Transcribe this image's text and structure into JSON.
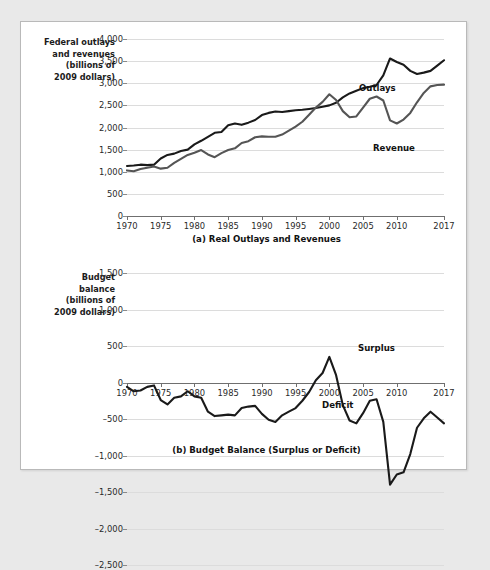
{
  "figure": {
    "background_color": "#e9e9e9",
    "card_color": "#ffffff",
    "border_color": "#b9b9b9"
  },
  "panel_a": {
    "axis_title": "Federal outlays\nand revenues\n(billions of\n2009 dollars)",
    "caption": "(a) Real Outlays and Revenues",
    "series_labels": {
      "outlays": "Outlays",
      "revenue": "Revenue"
    }
  },
  "panel_b": {
    "axis_title": "Budget\nbalance\n(billions of\n2009 dollars)",
    "caption": "(b) Budget Balance (Surplus or Deficit)",
    "series_labels": {
      "surplus": "Surplus",
      "deficit": "Deficit"
    }
  },
  "chart_data": [
    {
      "type": "line",
      "title": "(a) Real Outlays and Revenues",
      "xlabel": "",
      "ylabel": "Federal outlays and revenues (billions of 2009 dollars)",
      "xlim": [
        1970,
        2017
      ],
      "ylim": [
        0,
        4000
      ],
      "ytick_labels": [
        "4,000",
        "3,500",
        "3,000",
        "2,500",
        "2,000",
        "1,500",
        "1,000",
        "500",
        "0"
      ],
      "yticks": [
        4000,
        3500,
        3000,
        2500,
        2000,
        1500,
        1000,
        500,
        0
      ],
      "xtick_labels": [
        "1970",
        "1975",
        "1980",
        "1985",
        "1990",
        "1995",
        "2000",
        "2005",
        "2010",
        "2017"
      ],
      "xticks": [
        1970,
        1975,
        1980,
        1985,
        1990,
        1995,
        2000,
        2005,
        2010,
        2017
      ],
      "grid": true,
      "legend_position": "inline-annotation",
      "x": [
        1970,
        1971,
        1972,
        1973,
        1974,
        1975,
        1976,
        1977,
        1978,
        1979,
        1980,
        1981,
        1982,
        1983,
        1984,
        1985,
        1986,
        1987,
        1988,
        1989,
        1990,
        1991,
        1992,
        1993,
        1994,
        1995,
        1996,
        1997,
        1998,
        1999,
        2000,
        2001,
        2002,
        2003,
        2004,
        2005,
        2006,
        2007,
        2008,
        2009,
        2010,
        2011,
        2012,
        2013,
        2014,
        2015,
        2016,
        2017
      ],
      "series": [
        {
          "name": "Outlays",
          "color": "#1a1a1a",
          "values": [
            1130,
            1140,
            1160,
            1150,
            1160,
            1300,
            1380,
            1410,
            1470,
            1500,
            1620,
            1700,
            1790,
            1880,
            1900,
            2050,
            2090,
            2060,
            2110,
            2170,
            2280,
            2330,
            2360,
            2350,
            2370,
            2390,
            2400,
            2420,
            2440,
            2470,
            2500,
            2560,
            2680,
            2770,
            2830,
            2890,
            2920,
            2960,
            3180,
            3560,
            3480,
            3420,
            3280,
            3210,
            3240,
            3280,
            3400,
            3520
          ]
        },
        {
          "name": "Revenue",
          "color": "#555555",
          "values": [
            1030,
            1010,
            1060,
            1090,
            1120,
            1070,
            1090,
            1200,
            1290,
            1380,
            1430,
            1490,
            1390,
            1330,
            1420,
            1490,
            1530,
            1650,
            1690,
            1780,
            1800,
            1790,
            1790,
            1840,
            1930,
            2020,
            2130,
            2290,
            2450,
            2580,
            2750,
            2620,
            2370,
            2230,
            2250,
            2450,
            2650,
            2700,
            2610,
            2160,
            2090,
            2180,
            2330,
            2570,
            2780,
            2930,
            2960,
            2970
          ]
        }
      ]
    },
    {
      "type": "line",
      "title": "(b) Budget Balance (Surplus or Deficit)",
      "xlabel": "",
      "ylabel": "Budget balance (billions of 2009 dollars)",
      "xlim": [
        1970,
        2017
      ],
      "ylim": [
        -2500,
        1500
      ],
      "ytick_labels": [
        "1,500",
        "1,000",
        "500",
        "0",
        "–500",
        "–1,000",
        "–1,500",
        "–2,000",
        "–2,500"
      ],
      "yticks": [
        1500,
        1000,
        500,
        0,
        -500,
        -1000,
        -1500,
        -2000,
        -2500
      ],
      "xtick_labels": [
        "1970",
        "1975",
        "1980",
        "1985",
        "1990",
        "1995",
        "2000",
        "2005",
        "2010",
        "2017"
      ],
      "xticks": [
        1970,
        1975,
        1980,
        1985,
        1990,
        1995,
        2000,
        2005,
        2010,
        2017
      ],
      "grid": true,
      "legend_position": "inline-annotation",
      "x": [
        1970,
        1971,
        1972,
        1973,
        1974,
        1975,
        1976,
        1977,
        1978,
        1979,
        1980,
        1981,
        1982,
        1983,
        1984,
        1985,
        1986,
        1987,
        1988,
        1989,
        1990,
        1991,
        1992,
        1993,
        1994,
        1995,
        1996,
        1997,
        1998,
        1999,
        2000,
        2001,
        2002,
        2003,
        2004,
        2005,
        2006,
        2007,
        2008,
        2009,
        2010,
        2011,
        2012,
        2013,
        2014,
        2015,
        2016,
        2017
      ],
      "series": [
        {
          "name": "Budget balance",
          "color": "#1a1a1a",
          "values": [
            -60,
            -120,
            -110,
            -60,
            -40,
            -240,
            -300,
            -210,
            -190,
            -120,
            -190,
            -210,
            -400,
            -460,
            -450,
            -440,
            -450,
            -350,
            -330,
            -320,
            -430,
            -510,
            -540,
            -450,
            -400,
            -350,
            -250,
            -130,
            30,
            130,
            350,
            100,
            -310,
            -520,
            -560,
            -420,
            -250,
            -230,
            -540,
            -1400,
            -1260,
            -1230,
            -980,
            -620,
            -490,
            -400,
            -480,
            -560
          ]
        }
      ]
    }
  ]
}
